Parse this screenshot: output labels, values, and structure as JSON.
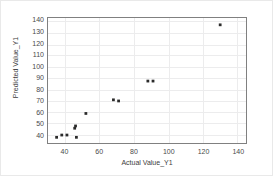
{
  "chart_data": {
    "type": "scatter",
    "title": "",
    "xlabel": "Actual Value_Y1",
    "ylabel": "Predicted Value_Y1",
    "xlim": [
      30,
      145
    ],
    "ylim": [
      33,
      143
    ],
    "xticks": [
      40,
      60,
      80,
      100,
      120,
      140
    ],
    "yticks": [
      40,
      50,
      60,
      70,
      80,
      90,
      100,
      110,
      120,
      130,
      140
    ],
    "xtick_labels": [
      "40",
      "60",
      "80",
      "100",
      "120",
      "140"
    ],
    "ytick_labels": [
      "40",
      "50",
      "60",
      "70",
      "80",
      "90",
      "100",
      "110",
      "120",
      "130",
      "140"
    ],
    "grid": true,
    "legend": false,
    "marker_color": "#2b2b2b",
    "grid_color": "#ececed",
    "frame_color": "#808080",
    "series": [
      {
        "name": "Predicted vs Actual",
        "x": [
          35,
          38,
          41,
          45.5,
          46,
          46.5,
          52,
          68,
          71,
          88,
          91,
          130
        ],
        "y": [
          38,
          40,
          40,
          46,
          48,
          38,
          59,
          71,
          70,
          87.5,
          87.5,
          137
        ]
      }
    ]
  }
}
